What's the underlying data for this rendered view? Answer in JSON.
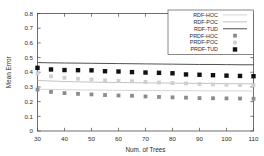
{
  "chart_data": {
    "type": "scatter",
    "title": "",
    "xlabel": "Num. of Trees",
    "ylabel": "Mean Error",
    "xlim": [
      30,
      110
    ],
    "ylim": [
      0,
      0.8
    ],
    "xticks": [
      30,
      40,
      50,
      60,
      70,
      80,
      90,
      100,
      110
    ],
    "xtick_labels": [
      "30",
      "40",
      "50",
      "60",
      "70",
      "80",
      "90",
      "100",
      "110"
    ],
    "yticks": [
      0,
      0.1,
      0.2,
      0.3,
      0.4,
      0.5,
      0.6,
      0.7,
      0.8
    ],
    "ytick_labels": [
      "0",
      "0.1",
      "0.2",
      "0.3",
      "0.4",
      "0.5",
      "0.6",
      "0.7",
      "0.8"
    ],
    "grid": false,
    "legend_position": "top-right",
    "x": [
      30,
      35,
      40,
      45,
      50,
      55,
      60,
      65,
      70,
      75,
      80,
      85,
      90,
      95,
      100,
      105,
      110
    ],
    "series": [
      {
        "name": "RDF-HOC",
        "style": "line",
        "color": "#c9c9c9",
        "values": [
          0.285,
          0.283,
          0.281,
          0.28,
          0.279,
          0.278,
          0.277,
          0.276,
          0.276,
          0.275,
          0.275,
          0.274,
          0.274,
          0.273,
          0.273,
          0.273,
          0.272
        ]
      },
      {
        "name": "RDF-POC",
        "style": "line",
        "color": "#b4b4b4",
        "values": [
          0.345,
          0.34,
          0.337,
          0.335,
          0.333,
          0.331,
          0.33,
          0.329,
          0.328,
          0.327,
          0.326,
          0.325,
          0.324,
          0.323,
          0.322,
          0.322,
          0.321
        ]
      },
      {
        "name": "RDF-TUD",
        "style": "line",
        "color": "#3d3d3d",
        "values": [
          0.466,
          0.464,
          0.463,
          0.462,
          0.461,
          0.46,
          0.459,
          0.458,
          0.457,
          0.456,
          0.455,
          0.454,
          0.453,
          0.453,
          0.452,
          0.451,
          0.451
        ]
      },
      {
        "name": "PRDF-HOC",
        "style": "marker",
        "color": "#8c8c8c",
        "values": [
          0.282,
          0.266,
          0.258,
          0.253,
          0.249,
          0.245,
          0.242,
          0.24,
          0.235,
          0.232,
          0.229,
          0.227,
          0.224,
          0.223,
          0.222,
          0.221,
          0.22
        ]
      },
      {
        "name": "PRDF-POC",
        "style": "marker",
        "color": "#cfcfcf",
        "values": [
          0.392,
          0.372,
          0.362,
          0.356,
          0.351,
          0.346,
          0.342,
          0.339,
          0.334,
          0.33,
          0.327,
          0.324,
          0.32,
          0.317,
          0.315,
          0.313,
          0.311
        ]
      },
      {
        "name": "PRDF-TUD",
        "style": "marker",
        "color": "#111111",
        "values": [
          0.43,
          0.419,
          0.415,
          0.414,
          0.413,
          0.407,
          0.405,
          0.401,
          0.398,
          0.396,
          0.393,
          0.385,
          0.383,
          0.38,
          0.377,
          0.375,
          0.373
        ]
      }
    ]
  },
  "legend": {
    "entries": [
      {
        "label": "RDF-HOC"
      },
      {
        "label": "RDF-POC"
      },
      {
        "label": "RDF-TUD"
      },
      {
        "label": "PRDF-HOC"
      },
      {
        "label": "PRDF-POC"
      },
      {
        "label": "PRDF-TUD"
      }
    ]
  }
}
